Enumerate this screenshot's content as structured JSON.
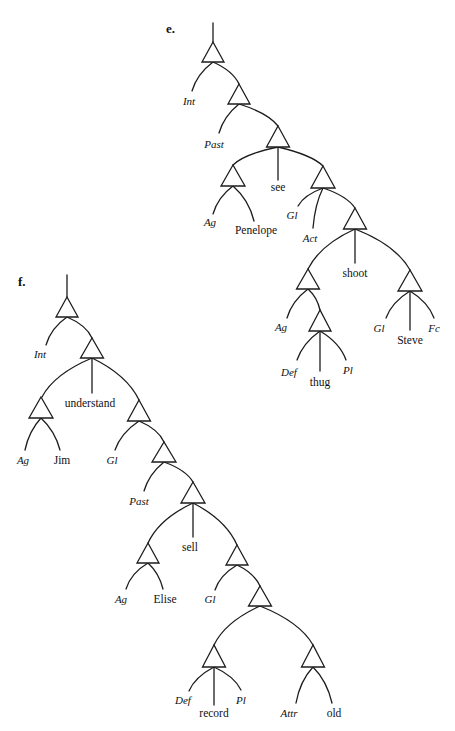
{
  "colors": {
    "background": "#ffffff",
    "ink": "#1c1c1c"
  },
  "tree_e": {
    "marker": "e.",
    "bracketing": "[Int [Past [[Ag Penelope] see [Gl Act [[Ag [Def thug Pl]] shoot [Gl Steve Fc]]]]]]",
    "labels": [
      "Int",
      "Past",
      "Ag",
      "Penelope",
      "see",
      "Gl",
      "Act",
      "shoot",
      "Ag",
      "Def",
      "thug",
      "Pl",
      "Gl",
      "Steve",
      "Fc"
    ]
  },
  "tree_f": {
    "marker": "f.",
    "bracketing": "[Int [[Ag Jim] understand [Gl [Past [[Ag Elise] sell [Gl [[Def record Pl] [Attr old]]]]]]]]",
    "labels": [
      "Int",
      "Ag",
      "Jim",
      "understand",
      "Gl",
      "Past",
      "Ag",
      "Elise",
      "sell",
      "Gl",
      "Def",
      "record",
      "Pl",
      "Attr",
      "old"
    ]
  }
}
